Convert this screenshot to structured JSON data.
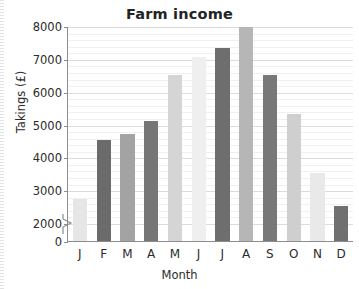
{
  "chart_data": {
    "type": "bar",
    "title": "Farm income",
    "xlabel": "Month",
    "ylabel": "Takings (£)",
    "categories": [
      "J",
      "F",
      "M",
      "A",
      "M",
      "J",
      "J",
      "A",
      "S",
      "O",
      "N",
      "D"
    ],
    "category_names": [
      "January",
      "February",
      "March",
      "April",
      "May",
      "June",
      "July",
      "August",
      "September",
      "October",
      "November",
      "December"
    ],
    "values": [
      2750,
      4550,
      4750,
      5150,
      6550,
      7100,
      7350,
      8000,
      6550,
      5350,
      3550,
      2550
    ],
    "bar_colors": [
      "#e6e6e6",
      "#6b6b6b",
      "#a3a3a3",
      "#767676",
      "#d5d5d5",
      "#efefef",
      "#6e6e6e",
      "#b6b6b6",
      "#787878",
      "#cfcfcf",
      "#e9e9e9",
      "#707070"
    ],
    "ylim": [
      2000,
      8000
    ],
    "y_axis_break": true,
    "y_break_note": "axis broken between 0 and 2000",
    "ytick_labels": [
      "0",
      "2000",
      "3000",
      "4000",
      "5000",
      "6000",
      "7000",
      "8000"
    ],
    "ytick_values": [
      0,
      2000,
      3000,
      4000,
      5000,
      6000,
      7000,
      8000
    ],
    "ymajor_step": 1000,
    "yminor_step": 200,
    "grid": true,
    "legend": false,
    "legend_position": "none"
  },
  "colors": {
    "axis": "#8d8d8d",
    "grid_major": "#dcdcdc",
    "grid_minor": "#f0f0f0",
    "text": "#2b2b2b",
    "background": "#ffffff"
  }
}
